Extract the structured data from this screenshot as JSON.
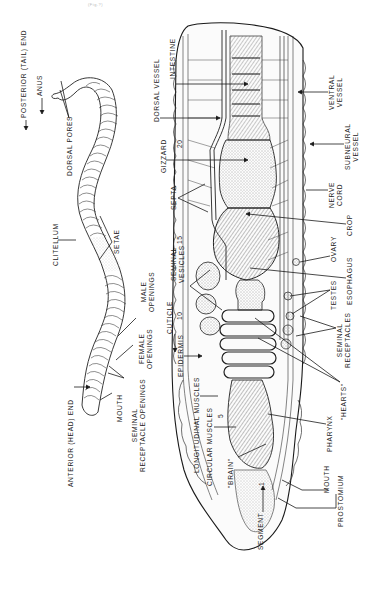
{
  "figure": {
    "orientation": "rotated 90 degrees counter-clockwise",
    "scan_mark": "(Fig.?)",
    "external_view": {
      "labels": [
        {
          "id": "posterior",
          "text": "POSTERIOR (TAIL) END"
        },
        {
          "id": "anus",
          "text": "ANUS"
        },
        {
          "id": "dorsal_pores",
          "text": "DORSAL PORES"
        },
        {
          "id": "clitellum",
          "text": "CLITELLUM"
        },
        {
          "id": "setae",
          "text": "SETAE"
        },
        {
          "id": "male_openings_1",
          "text": "MALE"
        },
        {
          "id": "male_openings_2",
          "text": "OPENINGS"
        },
        {
          "id": "female_openings_1",
          "text": "FEMALE"
        },
        {
          "id": "female_openings_2",
          "text": "OPENINGS"
        },
        {
          "id": "seminal_rec_openings_1",
          "text": "SEMINAL"
        },
        {
          "id": "seminal_rec_openings_2",
          "text": "RECEPTACLE OPENINGS"
        },
        {
          "id": "mouth_ext",
          "text": "MOUTH"
        },
        {
          "id": "anterior",
          "text": "ANTERIOR (HEAD) END"
        }
      ]
    },
    "internal_view": {
      "segment_numbers": [
        "1",
        "5",
        "10",
        "15",
        "20"
      ],
      "labels_left": [
        {
          "id": "dorsal_vessel",
          "text": "DORSAL VESSEL"
        },
        {
          "id": "intestine",
          "text": "INTESTINE"
        },
        {
          "id": "gizzard",
          "text": "GIZZARD"
        },
        {
          "id": "septa",
          "text": "SEPTA"
        },
        {
          "id": "seminal_vesicles_1",
          "text": "SEMINAL"
        },
        {
          "id": "seminal_vesicles_2",
          "text": "VESICLES"
        },
        {
          "id": "cuticle",
          "text": "CUTICLE"
        },
        {
          "id": "epidermis",
          "text": "EPIDERMIS"
        },
        {
          "id": "longitudinal_muscles",
          "text": "LONGITUDINAL MUSCLES"
        },
        {
          "id": "circular_muscles",
          "text": "CIRCULAR MUSCLES"
        },
        {
          "id": "brain",
          "text": "\"BRAIN\""
        },
        {
          "id": "segment",
          "text": "SEGMENT"
        }
      ],
      "labels_right": [
        {
          "id": "ventral_vessel_1",
          "text": "VENTRAL"
        },
        {
          "id": "ventral_vessel_2",
          "text": "VESSEL"
        },
        {
          "id": "subneural_vessel_1",
          "text": "SUBNEURAL"
        },
        {
          "id": "subneural_vessel_2",
          "text": "VESSEL"
        },
        {
          "id": "nerve_cord_1",
          "text": "NERVE"
        },
        {
          "id": "nerve_cord_2",
          "text": "CORD"
        },
        {
          "id": "crop",
          "text": "CROP"
        },
        {
          "id": "ovary",
          "text": "OVARY"
        },
        {
          "id": "esophagus",
          "text": "ESOPHAGUS"
        },
        {
          "id": "testes",
          "text": "TESTES"
        },
        {
          "id": "seminal_receptacles_1",
          "text": "SEMINAL"
        },
        {
          "id": "seminal_receptacles_2",
          "text": "RECEPTACLES"
        },
        {
          "id": "hearts",
          "text": "\"HEARTS\""
        },
        {
          "id": "pharynx",
          "text": "PHARYNX"
        },
        {
          "id": "mouth_int",
          "text": "MOUTH"
        },
        {
          "id": "prostomium",
          "text": "PROSTOMIUM"
        }
      ]
    },
    "colors": {
      "ink": "#1a1a1a",
      "background": "#ffffff",
      "stipple": "#555555"
    }
  }
}
